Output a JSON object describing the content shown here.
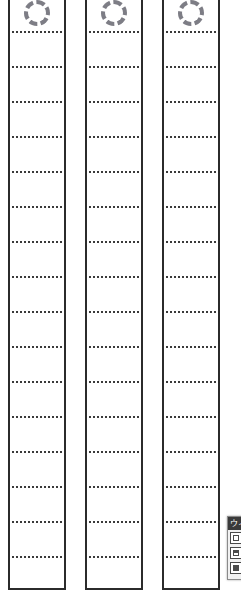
{
  "canvas": {
    "width": 241,
    "height": 593,
    "background_color": "#ffffff",
    "description": "Three tall vertical strip forms with dashed circular markers at top and evenly spaced dotted writing rules"
  },
  "style": {
    "strip_border_color": "#2b2b2b",
    "rule_color": "#3a3a3a",
    "circle_color": "#7d7d85",
    "palette_titlebar_color": "#3a3a3a",
    "palette_background_color": "#f1f1f1"
  },
  "strips": [
    {
      "id": "strip-1",
      "marker": "dashed-circle",
      "left": 8,
      "width": 58,
      "rule_count": 16,
      "rule_spacing": 35,
      "first_rule_y": 31
    },
    {
      "id": "strip-2",
      "marker": "dashed-circle",
      "left": 85,
      "width": 58,
      "rule_count": 16,
      "rule_spacing": 35,
      "first_rule_y": 31
    },
    {
      "id": "strip-3",
      "marker": "dashed-circle",
      "left": 162,
      "width": 58,
      "rule_count": 16,
      "rule_spacing": 35,
      "first_rule_y": 31
    }
  ],
  "rule_offsets": [
    31,
    66,
    101,
    136,
    171,
    206,
    241,
    276,
    311,
    346,
    381,
    416,
    451,
    486,
    521,
    556
  ],
  "palette": {
    "title": "ウィ",
    "buttons": [
      {
        "name": "outline-shape-button",
        "style": "outline"
      },
      {
        "name": "split-shape-button",
        "style": "split"
      },
      {
        "name": "filled-shape-button",
        "style": "filled"
      }
    ]
  }
}
